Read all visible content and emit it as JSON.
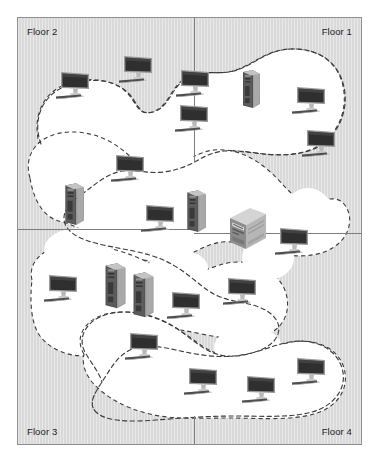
{
  "diagram": {
    "type": "floor-plan-network-diagram",
    "background_color": "#d9d9d9",
    "region_fill_color": "#ffffff",
    "boundary_style": "dashed",
    "boundary_color": "#3d3d3d",
    "border_color": "#8e8e8e",
    "divider_color": "#7d7d7d"
  },
  "floors": [
    {
      "id": "floor2",
      "label": "Floor 2",
      "position": "top-left"
    },
    {
      "id": "floor1",
      "label": "Floor 1",
      "position": "top-right"
    },
    {
      "id": "floor3",
      "label": "Floor 3",
      "position": "bottom-left"
    },
    {
      "id": "floor4",
      "label": "Floor 4",
      "position": "bottom-right"
    }
  ],
  "dividers": [
    {
      "id": "vertical-top",
      "orientation": "vertical",
      "x": 176,
      "y": 0,
      "length": 143
    },
    {
      "id": "horizontal-left",
      "orientation": "horizontal",
      "x": 0,
      "y": 211,
      "length": 176
    },
    {
      "id": "horizontal-right",
      "orientation": "horizontal",
      "x": 176,
      "y": 215,
      "length": 167
    },
    {
      "id": "vertical-bottom",
      "orientation": "vertical",
      "x": 176,
      "y": 398,
      "length": 28
    }
  ],
  "region": {
    "name": "network-coverage-region",
    "path": "M 18 118 C 14 96 26 74 50 66 C 70 59 92 62 104 74 C 116 86 112 100 128 96 C 146 92 150 70 168 62 C 186 54 196 62 214 56 C 232 50 244 36 268 34 C 296 32 316 44 322 66 C 329 90 322 112 310 124 C 296 138 272 140 252 138 C 228 136 206 132 188 136 C 170 140 158 150 140 150 C 122 150 112 142 100 144 C 86 146 80 156 66 158 C 44 162 26 146 18 130 Z",
    "devices_total": 24
  },
  "devices": [
    {
      "id": "d1",
      "kind": "desktop-monitor",
      "floor": "floor2",
      "x": 36,
      "y": 52,
      "scale": 1.0
    },
    {
      "id": "d2",
      "kind": "desktop-monitor",
      "floor": "floor2",
      "x": 99,
      "y": 36,
      "scale": 1.0
    },
    {
      "id": "d3",
      "kind": "desktop-monitor",
      "floor": "floor1",
      "x": 156,
      "y": 50,
      "scale": 1.0
    },
    {
      "id": "d4",
      "kind": "desktop-monitor",
      "floor": "floor1",
      "x": 155,
      "y": 85,
      "scale": 1.0
    },
    {
      "id": "d5",
      "kind": "tower-server",
      "floor": "floor1",
      "x": 222,
      "y": 50,
      "scale": 1.0
    },
    {
      "id": "d6",
      "kind": "desktop-monitor",
      "floor": "floor1",
      "x": 272,
      "y": 67,
      "scale": 1.0
    },
    {
      "id": "d7",
      "kind": "desktop-monitor",
      "floor": "floor1",
      "x": 282,
      "y": 110,
      "scale": 1.0
    },
    {
      "id": "d8",
      "kind": "desktop-monitor",
      "floor": "floor2",
      "x": 91,
      "y": 135,
      "scale": 1.0
    },
    {
      "id": "d9",
      "kind": "tower-server",
      "floor": "floor2",
      "x": 44,
      "y": 163,
      "scale": 1.1
    },
    {
      "id": "d10",
      "kind": "desktop-monitor",
      "floor": "floor2",
      "x": 121,
      "y": 185,
      "scale": 1.0
    },
    {
      "id": "d11",
      "kind": "tower-server",
      "floor": "floor2",
      "x": 166,
      "y": 170,
      "scale": 1.1
    },
    {
      "id": "d12",
      "kind": "mainframe-server",
      "floor": "floor1",
      "x": 208,
      "y": 188,
      "scale": 1.0
    },
    {
      "id": "d13",
      "kind": "desktop-monitor",
      "floor": "floor4",
      "x": 255,
      "y": 208,
      "scale": 1.0
    },
    {
      "id": "d14",
      "kind": "desktop-monitor",
      "floor": "floor3",
      "x": 24,
      "y": 255,
      "scale": 1.0
    },
    {
      "id": "d15",
      "kind": "tower-server",
      "floor": "floor3",
      "x": 84,
      "y": 243,
      "scale": 1.18
    },
    {
      "id": "d16",
      "kind": "tower-server",
      "floor": "floor3",
      "x": 112,
      "y": 252,
      "scale": 1.18
    },
    {
      "id": "d17",
      "kind": "desktop-monitor",
      "floor": "floor3",
      "x": 147,
      "y": 272,
      "scale": 1.0
    },
    {
      "id": "d18",
      "kind": "desktop-monitor",
      "floor": "floor4",
      "x": 203,
      "y": 258,
      "scale": 1.0
    },
    {
      "id": "d19",
      "kind": "desktop-monitor",
      "floor": "floor3",
      "x": 105,
      "y": 313,
      "scale": 1.0
    },
    {
      "id": "d20",
      "kind": "desktop-monitor",
      "floor": "floor4",
      "x": 164,
      "y": 348,
      "scale": 1.0
    },
    {
      "id": "d21",
      "kind": "desktop-monitor",
      "floor": "floor4",
      "x": 222,
      "y": 356,
      "scale": 1.0
    },
    {
      "id": "d22",
      "kind": "desktop-monitor",
      "floor": "floor4",
      "x": 272,
      "y": 338,
      "scale": 1.0
    }
  ]
}
